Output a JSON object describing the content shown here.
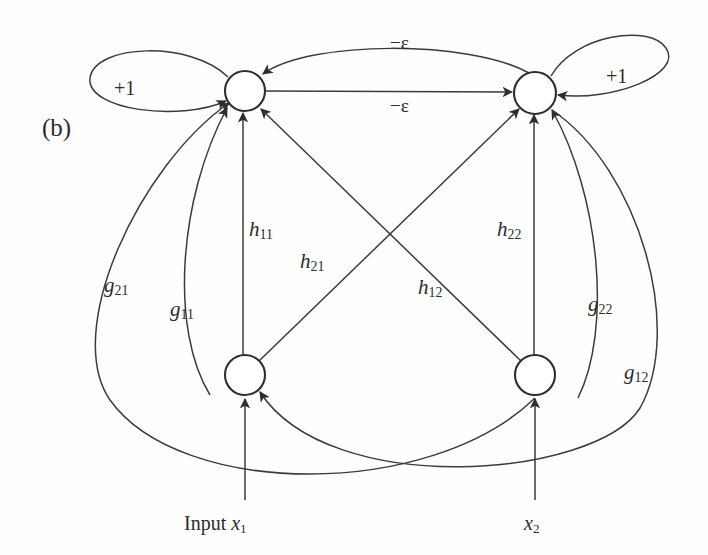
{
  "figure": {
    "panel_label": "(b)",
    "type": "recurrent-neural-network-signal-flow-graph",
    "background_color": "#fefefe",
    "line_color": "#3b3b3b",
    "node_stroke_color": "#2e2e2e"
  },
  "nodes": [
    {
      "id": "top-left",
      "name": "output-neuron-1",
      "cx": 245,
      "cy": 91,
      "r": 20
    },
    {
      "id": "top-right",
      "name": "output-neuron-2",
      "cx": 535,
      "cy": 93,
      "r": 21
    },
    {
      "id": "bottom-left",
      "name": "input-neuron-1",
      "cx": 245,
      "cy": 375,
      "r": 20
    },
    {
      "id": "bottom-right",
      "name": "input-neuron-2",
      "cx": 535,
      "cy": 375,
      "r": 20
    }
  ],
  "self_loops": [
    {
      "name": "self-loop-left",
      "label": "+1",
      "label_x": 114,
      "label_y": 78
    },
    {
      "name": "self-loop-right",
      "label": "+1",
      "label_x": 606,
      "label_y": 66
    }
  ],
  "lateral_edges": [
    {
      "name": "lateral-edge-top",
      "label": "−ε",
      "label_x": 390,
      "label_y": 33
    },
    {
      "name": "lateral-edge-bottom",
      "label": "−ε",
      "label_x": 390,
      "label_y": 96
    }
  ],
  "weights": [
    {
      "name": "weight-h11",
      "base": "h",
      "sub": "11",
      "label_x": 249,
      "label_y": 219
    },
    {
      "name": "weight-h21",
      "base": "h",
      "sub": "21",
      "label_x": 300,
      "label_y": 251
    },
    {
      "name": "weight-h12",
      "base": "h",
      "sub": "12",
      "label_x": 418,
      "label_y": 277
    },
    {
      "name": "weight-h22",
      "base": "h",
      "sub": "22",
      "label_x": 497,
      "label_y": 219
    },
    {
      "name": "weight-g21",
      "base": "g",
      "sub": "21",
      "label_x": 104,
      "label_y": 275
    },
    {
      "name": "weight-g11",
      "base": "g",
      "sub": "11",
      "label_x": 170,
      "label_y": 299
    },
    {
      "name": "weight-g22",
      "base": "g",
      "sub": "22",
      "label_x": 588,
      "label_y": 294
    },
    {
      "name": "weight-g12",
      "base": "g",
      "sub": "12",
      "label_x": 624,
      "label_y": 362
    }
  ],
  "inputs": [
    {
      "name": "input-label-x1",
      "prefix": "Input ",
      "var": "x",
      "sub": "1",
      "label_x": 184,
      "label_y": 513
    },
    {
      "name": "input-label-x2",
      "prefix": "",
      "var": "x",
      "sub": "2",
      "label_x": 524,
      "label_y": 513
    }
  ]
}
